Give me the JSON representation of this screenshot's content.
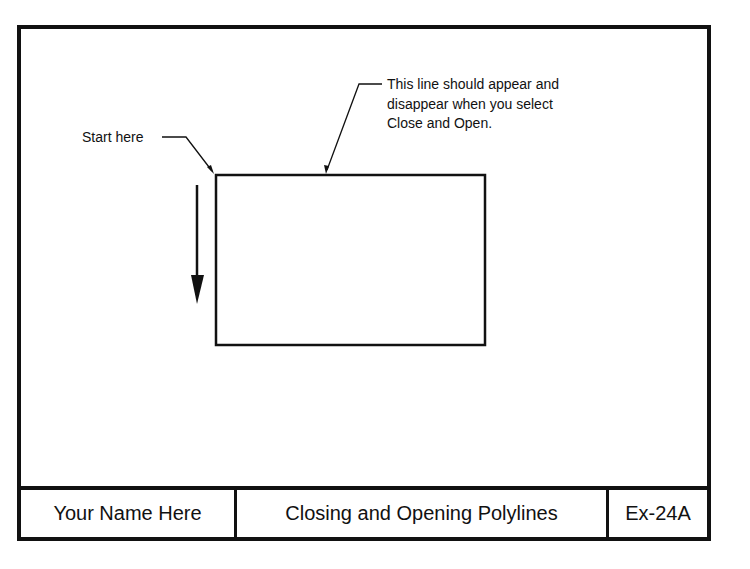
{
  "drawing": {
    "annotations": {
      "start_label": "Start here",
      "line_note": [
        "This line should appear and",
        "disappear when you select",
        "Close and Open."
      ]
    },
    "shapes": {
      "rectangle": {
        "x": 216,
        "y": 175,
        "width": 269,
        "height": 170
      },
      "direction_arrow": {
        "x": 197,
        "y_start": 185,
        "y_end": 304,
        "direction": "down"
      }
    },
    "line_color": "#111111"
  },
  "title_block": {
    "name": "Your Name Here",
    "title": "Closing and Opening Polylines",
    "code": "Ex-24A"
  }
}
